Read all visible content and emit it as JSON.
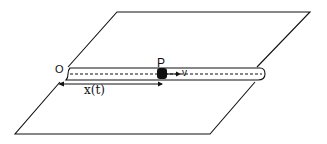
{
  "diagram": {
    "labels": {
      "origin": "O",
      "particle": "P",
      "velocity": "v",
      "position": "x(t)"
    },
    "colors": {
      "stroke": "#111111",
      "background": "#ffffff",
      "particle_fill": "#111111"
    }
  }
}
